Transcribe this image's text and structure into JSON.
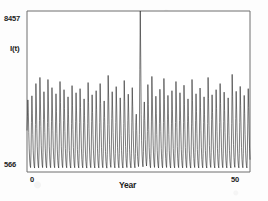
{
  "figure": {
    "name": "epidemic-time-series-figure",
    "background_color": "#fdfdfd",
    "line_color": "#2b2b2b",
    "axis_color": "#6f6f6f"
  },
  "labels": {
    "y_max": "8457",
    "y_min": "566",
    "y_title": "I(t)",
    "x_min": "0",
    "x_max": "50",
    "x_title": "Year"
  },
  "chart_data": {
    "type": "line",
    "title": "",
    "subtitle": "",
    "xlabel": "Year",
    "ylabel": "I(t)",
    "xlim": [
      0,
      50
    ],
    "ylim": [
      566,
      8457
    ],
    "xticks": [
      0,
      50
    ],
    "xticklabels": [
      "0",
      "50"
    ],
    "yticks": [
      566,
      8457
    ],
    "yticklabels": [
      "566",
      "8457"
    ],
    "grid": false,
    "legend": null,
    "legend_position": "none",
    "frame": "box",
    "annotations": [],
    "series": [
      {
        "name": "I(t)",
        "color": "#2b2b2b",
        "x": [
          0.0,
          0.1,
          0.2,
          0.3,
          0.4,
          0.5,
          0.6,
          0.7,
          0.8,
          0.9,
          1.0,
          1.1,
          1.2,
          1.3,
          1.4,
          1.5,
          1.6,
          1.7,
          1.8,
          1.9,
          2.0,
          2.1,
          2.2,
          2.3,
          2.4,
          2.5,
          2.6,
          2.7,
          2.8,
          2.9,
          3.0,
          3.1,
          3.2,
          3.3,
          3.4,
          3.5,
          3.6,
          3.7,
          3.8,
          3.9,
          4.0,
          4.1,
          4.2,
          4.3,
          4.4,
          4.5,
          4.6,
          4.7,
          4.8,
          4.9,
          5.0,
          5.1,
          5.2,
          5.3,
          5.4,
          5.5,
          5.6,
          5.7,
          5.8,
          5.9,
          6.0,
          6.1,
          6.2,
          6.3,
          6.4,
          6.5,
          6.6,
          6.7,
          6.8,
          6.9,
          7.0,
          7.1,
          7.2,
          7.3,
          7.4,
          7.5,
          7.6,
          7.7,
          7.8,
          7.9,
          8.0,
          8.1,
          8.2,
          8.3,
          8.4,
          8.5,
          8.6,
          8.7,
          8.8,
          8.9,
          9.0,
          9.1,
          9.2,
          9.3,
          9.4,
          9.5,
          9.6,
          9.7,
          9.8,
          9.9,
          10.0,
          10.1,
          10.2,
          10.3,
          10.4,
          10.5,
          10.6,
          10.7,
          10.8,
          10.9,
          11.0,
          11.1,
          11.2,
          11.3,
          11.4,
          11.5,
          11.6,
          11.7,
          11.8,
          11.9,
          12.0,
          12.1,
          12.2,
          12.3,
          12.4,
          12.5,
          12.6,
          12.7,
          12.8,
          12.9,
          13.0,
          13.1,
          13.2,
          13.3,
          13.4,
          13.5,
          13.6,
          13.7,
          13.8,
          13.9,
          14.0,
          14.1,
          14.2,
          14.3,
          14.4,
          14.5,
          14.6,
          14.7,
          14.8,
          14.9,
          15.0,
          15.1,
          15.2,
          15.3,
          15.4,
          15.5,
          15.6,
          15.7,
          15.8,
          15.9,
          16.0,
          16.1,
          16.2,
          16.3,
          16.4,
          16.5,
          16.6,
          16.7,
          16.8,
          16.9,
          17.0,
          17.1,
          17.2,
          17.3,
          17.4,
          17.5,
          17.6,
          17.7,
          17.8,
          17.9,
          18.0,
          18.1,
          18.2,
          18.3,
          18.4,
          18.5,
          18.6,
          18.7,
          18.8,
          18.9,
          19.0,
          19.1,
          19.2,
          19.3,
          19.4,
          19.5,
          19.6,
          19.7,
          19.8,
          19.9,
          20.0,
          20.1,
          20.2,
          20.3,
          20.4,
          20.5,
          20.6,
          20.7,
          20.8,
          20.9,
          21.0,
          21.1,
          21.2,
          21.3,
          21.4,
          21.5,
          21.6,
          21.7,
          21.8,
          21.9,
          22.0,
          22.1,
          22.2,
          22.3,
          22.4,
          22.5,
          22.6,
          22.7,
          22.8,
          22.9,
          23.0,
          23.1,
          23.2,
          23.3,
          23.4,
          23.5,
          23.6,
          23.7,
          23.8,
          23.9,
          24.0,
          24.1,
          24.2,
          24.3,
          24.4,
          24.5,
          24.6,
          24.7,
          24.8,
          24.9,
          25.0,
          25.1,
          25.2,
          25.3,
          25.4,
          25.5,
          25.6,
          25.7,
          25.8,
          25.9,
          26.0,
          26.1,
          26.2,
          26.3,
          26.4,
          26.5,
          26.6,
          26.7,
          26.8,
          26.9,
          27.0,
          27.1,
          27.2,
          27.3,
          27.4,
          27.5,
          27.6,
          27.7,
          27.8,
          27.9,
          28.0,
          28.1,
          28.2,
          28.3,
          28.4,
          28.5,
          28.6,
          28.7,
          28.8,
          28.9,
          29.0,
          29.1,
          29.2,
          29.3,
          29.4,
          29.5,
          29.6,
          29.7,
          29.8,
          29.9,
          30.0,
          30.1,
          30.2,
          30.3,
          30.4,
          30.5,
          30.6,
          30.7,
          30.8,
          30.9,
          31.0,
          31.1,
          31.2,
          31.3,
          31.4,
          31.5,
          31.6,
          31.7,
          31.8,
          31.9,
          32.0,
          32.1,
          32.2,
          32.3,
          32.4,
          32.5,
          32.6,
          32.7,
          32.8,
          32.9,
          33.0,
          33.1,
          33.2,
          33.3,
          33.4,
          33.5,
          33.6,
          33.7,
          33.8,
          33.9,
          34.0,
          34.1,
          34.2,
          34.3,
          34.4,
          34.5,
          34.6,
          34.7,
          34.8,
          34.9,
          35.0,
          35.1,
          35.2,
          35.3,
          35.4,
          35.5,
          35.6,
          35.7,
          35.8,
          35.9,
          36.0,
          36.1,
          36.2,
          36.3,
          36.4,
          36.5,
          36.6,
          36.7,
          36.8,
          36.9,
          37.0,
          37.1,
          37.2,
          37.3,
          37.4,
          37.5,
          37.6,
          37.7,
          37.8,
          37.9,
          38.0,
          38.1,
          38.2,
          38.3,
          38.4,
          38.5,
          38.6,
          38.7,
          38.8,
          38.9,
          39.0,
          39.1,
          39.2,
          39.3,
          39.4,
          39.5,
          39.6,
          39.7,
          39.8,
          39.9,
          40.0,
          40.1,
          40.2,
          40.3,
          40.4,
          40.5,
          40.6,
          40.7,
          40.8,
          40.9,
          41.0,
          41.1,
          41.2,
          41.3,
          41.4,
          41.5,
          41.6,
          41.7,
          41.8,
          41.9,
          42.0,
          42.1,
          42.2,
          42.3,
          42.4,
          42.5,
          42.6,
          42.7,
          42.8,
          42.9,
          43.0,
          43.1,
          43.2,
          43.3,
          43.4,
          43.5,
          43.6,
          43.7,
          43.8,
          43.9,
          44.0,
          44.1,
          44.2,
          44.3,
          44.4,
          44.5,
          44.6,
          44.7,
          44.8,
          44.9,
          45.0,
          45.1,
          45.2,
          45.3,
          45.4,
          45.5,
          45.6,
          45.7,
          45.8,
          45.9,
          46.0,
          46.1,
          46.2,
          46.3,
          46.4,
          46.5,
          46.6,
          46.7,
          46.8,
          46.9,
          47.0,
          47.1,
          47.2,
          47.3,
          47.4,
          47.5,
          47.6,
          47.7,
          47.8,
          47.9,
          48.0,
          48.1,
          48.2,
          48.3,
          48.4,
          48.5,
          48.6,
          48.7,
          48.8,
          48.9,
          49.0,
          49.1,
          49.2,
          49.3,
          49.4,
          49.5,
          49.6,
          49.7,
          49.8,
          49.9,
          50.0
        ],
        "y": [
          2600,
          3300,
          4100,
          3500,
          2500,
          1700,
          1150,
          900,
          780,
          1500,
          3000,
          4300,
          3450,
          2400,
          1600,
          1100,
          870,
          760,
          1450,
          2900,
          4900,
          3900,
          2700,
          1800,
          1200,
          900,
          770,
          1500,
          3100,
          5200,
          4100,
          2800,
          1850,
          1250,
          920,
          780,
          1520,
          3150,
          4500,
          3600,
          2500,
          1700,
          1150,
          880,
          770,
          1480,
          3000,
          5100,
          4050,
          2750,
          1800,
          1200,
          900,
          775,
          1500,
          3050,
          4700,
          3750,
          2600,
          1750,
          1180,
          890,
          775,
          1490,
          3020,
          4400,
          3520,
          2450,
          1650,
          1120,
          880,
          765,
          1460,
          2980,
          5000,
          3980,
          2720,
          1800,
          1210,
          905,
          778,
          1505,
          3080,
          4600,
          3680,
          2550,
          1720,
          1160,
          885,
          772,
          1475,
          3010,
          4250,
          3400,
          2380,
          1620,
          1105,
          875,
          762,
          1445,
          2950,
          4800,
          3840,
          2650,
          1770,
          1190,
          895,
          774,
          1485,
          3030,
          4450,
          3560,
          2470,
          1670,
          1130,
          882,
          768,
          1465,
          2990,
          4650,
          3720,
          2580,
          1740,
          1170,
          888,
          771,
          1478,
          3005,
          4150,
          3320,
          2330,
          1595,
          1090,
          870,
          760,
          1440,
          2930,
          4950,
          3960,
          2700,
          1790,
          1205,
          900,
          776,
          1495,
          3040,
          4350,
          3480,
          2420,
          1640,
          1115,
          878,
          764,
          1452,
          2965,
          4550,
          3640,
          2520,
          1705,
          1150,
          884,
          769,
          1470,
          2995,
          4900,
          3920,
          2680,
          1780,
          1196,
          897,
          775,
          1488,
          3025,
          4050,
          3240,
          2280,
          1565,
          1075,
          866,
          757,
          1432,
          2910,
          5300,
          4240,
          2900,
          1900,
          1260,
          930,
          790,
          1540,
          3180,
          4500,
          3600,
          2500,
          1690,
          1140,
          882,
          767,
          1468,
          2985,
          4750,
          3800,
          2620,
          1755,
          1182,
          892,
          772,
          1480,
          3015,
          4200,
          3360,
          2350,
          1608,
          1098,
          872,
          761,
          1442,
          2940,
          5050,
          4040,
          2760,
          1820,
          1220,
          910,
          780,
          1512,
          3090,
          4380,
          3500,
          2440,
          1655,
          1125,
          880,
          766,
          1458,
          2975,
          4700,
          3760,
          2600,
          1745,
          1175,
          890,
          770,
          1474,
          3000,
          3400,
          2600,
          1850,
          1320,
          1010,
          830,
          1200,
          2400,
          5600,
          8457,
          6200,
          3400,
          2100,
          1400,
          1000,
          820,
          1560,
          3200,
          4000,
          3100,
          2150,
          1500,
          1080,
          860,
          1250,
          2550,
          4850,
          3880,
          2660,
          1765,
          1185,
          893,
          773,
          1483,
          3020,
          5250,
          4200,
          2870,
          1880,
          1250,
          925,
          788,
          1530,
          3160,
          4280,
          3420,
          2400,
          1630,
          1110,
          876,
          763,
          1450,
          2955,
          4620,
          3700,
          2560,
          1730,
          1165,
          886,
          770,
          1472,
          2998,
          5150,
          4120,
          2820,
          1850,
          1235,
          918,
          784,
          1520,
          3120,
          4320,
          3450,
          2410,
          1635,
          1112,
          877,
          763,
          1451,
          2958,
          4550,
          3640,
          2530,
          1710,
          1155,
          883,
          768,
          1466,
          2992,
          5000,
          4000,
          2740,
          1810,
          1215,
          908,
          779,
          1508,
          3085,
          4450,
          3560,
          2480,
          1680,
          1135,
          881,
          767,
          1462,
          2980,
          4820,
          3860,
          2660,
          1770,
          1192,
          896,
          774,
          1486,
          3028,
          4150,
          3320,
          2330,
          1600,
          1092,
          871,
          760,
          1438,
          2925,
          5100,
          4080,
          2790,
          1835,
          1228,
          913,
          782,
          1516,
          3100,
          4400,
          3520,
          2460,
          1665,
          1128,
          879,
          765,
          1455,
          2970,
          4680,
          3740,
          2590,
          1750,
          1178,
          891,
          771,
          1476,
          3002,
          4250,
          3400,
          2390,
          1625,
          1108,
          874,
          762,
          1448,
          2945,
          5200,
          4160,
          2840,
          1860,
          1240,
          920,
          786,
          1525,
          3140,
          4350,
          3480,
          2430,
          1648,
          1120,
          878,
          764,
          1454,
          2968,
          4600,
          3680,
          2550,
          1720,
          1160,
          885,
          769,
          1470,
          2996,
          4900,
          3920,
          2690,
          1785,
          1198,
          898,
          776,
          1490,
          3035,
          4480,
          3580,
          2500,
          1690,
          1140,
          882,
          766,
          1460,
          2975,
          4200,
          3360,
          2360,
          1612,
          1100,
          873,
          761,
          1444,
          2935,
          5350,
          4280,
          2920,
          1910,
          1265,
          932,
          792,
          1545,
          3190,
          4520,
          3610,
          2510,
          1698,
          1145,
          883,
          768,
          1468,
          2988,
          4760,
          3810,
          2630,
          1760,
          1185,
          893,
          773,
          1482,
          3018,
          4320,
          3450,
          2415,
          1638,
          1114,
          876,
          763,
          1452,
          2960,
          4650,
          3720,
          2580,
          1735,
          1170
        ]
      }
    ]
  }
}
